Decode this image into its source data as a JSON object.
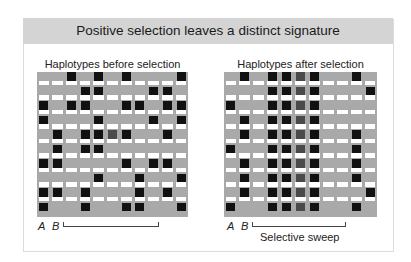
{
  "title": "Positive selection leaves a distinct signature",
  "colors": {
    "title_bar": "#d4d4d4",
    "haplotype_band": "#a9a9a9",
    "snp": "#111111",
    "snp_sweep_center": "#4a4a4a"
  },
  "before": {
    "label": "Haplotypes before selection",
    "columns": 11,
    "rows": [
      [
        3,
        5,
        7,
        11
      ],
      [
        4,
        5,
        9,
        10
      ],
      [
        1,
        3,
        4,
        7,
        8,
        10,
        11
      ],
      [
        1,
        5,
        9,
        11
      ],
      [
        2,
        4,
        5,
        "6g",
        7,
        10
      ],
      [
        2,
        4,
        5
      ],
      [
        1,
        2,
        7,
        9,
        10
      ],
      [
        5,
        8,
        11
      ],
      [
        1,
        2,
        4,
        8,
        10
      ],
      [
        1,
        4,
        7,
        8,
        11
      ]
    ],
    "marker_a": "A",
    "marker_b": "B"
  },
  "after": {
    "label": "Haplotypes after selection",
    "columns": 11,
    "rows": [
      [
        2,
        4,
        5,
        "6g",
        7,
        10
      ],
      [
        4,
        5,
        "6g",
        7,
        11
      ],
      [
        1,
        4,
        5,
        "6g",
        7
      ],
      [
        2,
        4,
        5,
        "6g",
        7
      ],
      [
        2,
        4,
        5,
        "6g",
        7,
        10
      ],
      [
        1,
        4,
        5,
        "6g",
        7,
        10
      ],
      [
        2,
        4,
        5,
        "6g",
        7,
        10
      ],
      [
        2,
        4,
        5,
        "6g",
        7,
        10
      ],
      [
        2,
        4,
        5,
        "6g",
        7,
        11
      ],
      [
        1,
        4,
        5,
        "6g",
        7,
        10
      ]
    ],
    "marker_a": "A",
    "marker_b": "B",
    "sweep_label": "Selective sweep"
  }
}
